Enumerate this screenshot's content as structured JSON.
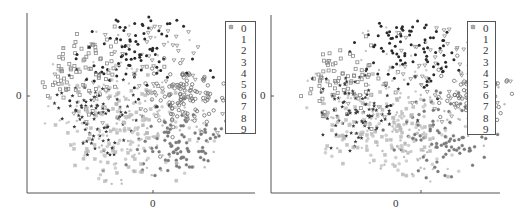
{
  "chart_data": [
    {
      "type": "scatter",
      "title": "",
      "xlabel": "",
      "ylabel": "",
      "x_ticks": [
        "0"
      ],
      "y_ticks": [
        "0"
      ],
      "grid": false,
      "legend_position": "upper right",
      "legend": [
        "0",
        "1",
        "2",
        "3",
        "4",
        "5",
        "6",
        "7",
        "8",
        "9"
      ],
      "description": "2D embedding of 10 classes forming a roughly circular cloud",
      "series": [
        {
          "name": "0",
          "marker": "square",
          "color": "#8a8a8a",
          "center": [
            -0.65,
            0.4
          ],
          "spread": 0.3,
          "count": 80
        },
        {
          "name": "1",
          "marker": "circle",
          "color": "#6e6e6e",
          "center": [
            0.45,
            0.05
          ],
          "spread": 0.16,
          "count": 110
        },
        {
          "name": "2",
          "marker": "dot",
          "color": "#c8c8c8",
          "center": [
            -0.1,
            0.1
          ],
          "spread": 0.45,
          "count": 70
        },
        {
          "name": "3",
          "marker": "filled-circle",
          "color": "#2a2a2a",
          "center": [
            -0.05,
            0.6
          ],
          "spread": 0.28,
          "count": 90
        },
        {
          "name": "4",
          "marker": "dot",
          "color": "#bdbdbd",
          "center": [
            0.05,
            -0.35
          ],
          "spread": 0.35,
          "count": 70
        },
        {
          "name": "5",
          "marker": "circle-light",
          "color": "#c4c4c4",
          "center": [
            -0.05,
            -0.45
          ],
          "spread": 0.3,
          "count": 70
        },
        {
          "name": "6",
          "marker": "star",
          "color": "#3a3a3a",
          "center": [
            -0.45,
            -0.2
          ],
          "spread": 0.25,
          "count": 90
        },
        {
          "name": "7",
          "marker": "asterisk",
          "color": "#7a7a7a",
          "center": [
            0.4,
            -0.5
          ],
          "spread": 0.22,
          "count": 90
        },
        {
          "name": "8",
          "marker": "triangle-down",
          "color": "#8f8f8f",
          "center": [
            0.2,
            0.4
          ],
          "spread": 0.4,
          "count": 60
        },
        {
          "name": "9",
          "marker": "square-light",
          "color": "#b5b5b5",
          "center": [
            -0.2,
            -0.35
          ],
          "spread": 0.35,
          "count": 80
        }
      ]
    },
    {
      "type": "scatter",
      "title": "",
      "xlabel": "",
      "ylabel": "",
      "x_ticks": [
        "0"
      ],
      "y_ticks": [
        "0"
      ],
      "grid": false,
      "legend_position": "upper right",
      "legend": [
        "0",
        "1",
        "2",
        "3",
        "4",
        "5",
        "6",
        "7",
        "8",
        "9"
      ],
      "description": "2D embedding of 10 classes forming a roughly circular cloud",
      "series": [
        {
          "name": "0",
          "marker": "square",
          "color": "#8a8a8a",
          "center": [
            -0.7,
            0.3
          ],
          "spread": 0.28,
          "count": 80
        },
        {
          "name": "1",
          "marker": "circle",
          "color": "#6e6e6e",
          "center": [
            0.65,
            0.1
          ],
          "spread": 0.15,
          "count": 110
        },
        {
          "name": "2",
          "marker": "dot",
          "color": "#c8c8c8",
          "center": [
            -0.15,
            0.2
          ],
          "spread": 0.45,
          "count": 70
        },
        {
          "name": "3",
          "marker": "filled-circle",
          "color": "#2a2a2a",
          "center": [
            0.05,
            0.65
          ],
          "spread": 0.25,
          "count": 90
        },
        {
          "name": "4",
          "marker": "dot",
          "color": "#bdbdbd",
          "center": [
            0.1,
            -0.3
          ],
          "spread": 0.35,
          "count": 70
        },
        {
          "name": "5",
          "marker": "circle-light",
          "color": "#c4c4c4",
          "center": [
            -0.1,
            -0.4
          ],
          "spread": 0.3,
          "count": 70
        },
        {
          "name": "6",
          "marker": "star",
          "color": "#3a3a3a",
          "center": [
            -0.45,
            -0.15
          ],
          "spread": 0.22,
          "count": 90
        },
        {
          "name": "7",
          "marker": "asterisk",
          "color": "#7a7a7a",
          "center": [
            0.35,
            -0.4
          ],
          "spread": 0.22,
          "count": 90
        },
        {
          "name": "8",
          "marker": "triangle-down",
          "color": "#8f8f8f",
          "center": [
            0.35,
            0.45
          ],
          "spread": 0.35,
          "count": 60
        },
        {
          "name": "9",
          "marker": "square-light",
          "color": "#b5b5b5",
          "center": [
            -0.3,
            -0.35
          ],
          "spread": 0.3,
          "count": 80
        }
      ]
    }
  ],
  "panels": [
    {
      "y_tick_label": "0",
      "x_tick_label": "0",
      "legend_items": [
        {
          "label": "0"
        },
        {
          "label": "1"
        },
        {
          "label": "2"
        },
        {
          "label": "3"
        },
        {
          "label": "4"
        },
        {
          "label": "5"
        },
        {
          "label": "6"
        },
        {
          "label": "7"
        },
        {
          "label": "8"
        },
        {
          "label": "9"
        }
      ]
    },
    {
      "y_tick_label": "0",
      "x_tick_label": "0",
      "legend_items": [
        {
          "label": "0"
        },
        {
          "label": "1"
        },
        {
          "label": "2"
        },
        {
          "label": "3"
        },
        {
          "label": "4"
        },
        {
          "label": "5"
        },
        {
          "label": "6"
        },
        {
          "label": "7"
        },
        {
          "label": "8"
        },
        {
          "label": "9"
        }
      ]
    }
  ],
  "layout": {
    "left": {
      "axis_x0": 27,
      "axis_y_top": 13,
      "axis_y0": 193,
      "axis_x_end": 255,
      "center": [
        140,
        102
      ],
      "radius": [
        100,
        88
      ],
      "legend": [
        225,
        21,
        31,
        113
      ]
    },
    "right": {
      "axis_x0": 13,
      "axis_y_top": 15,
      "axis_y0": 193,
      "axis_x_end": 242,
      "center": [
        150,
        102
      ],
      "radius": [
        108,
        82
      ],
      "legend": [
        209,
        21,
        29,
        114
      ]
    }
  }
}
